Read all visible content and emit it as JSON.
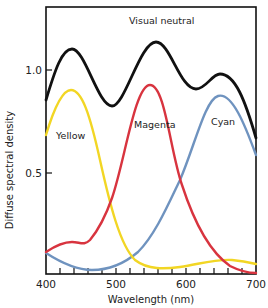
{
  "chart_data": {
    "type": "line",
    "title": "",
    "xlabel": "Wavelength (nm)",
    "ylabel": "Diffuse spectral density",
    "xlim": [
      400,
      700
    ],
    "ylim": [
      0,
      1.3
    ],
    "grid": false,
    "legend": "inline labels",
    "x_ticks": [
      400,
      500,
      600,
      700
    ],
    "x_tick_labels": [
      "400",
      "500",
      "600",
      "700"
    ],
    "x_minor_tick_step": 20,
    "y_ticks": [
      0.5,
      1.0
    ],
    "y_tick_labels": [
      "0.5",
      "1.0"
    ],
    "x": [
      400,
      420,
      440,
      460,
      480,
      500,
      520,
      540,
      560,
      580,
      600,
      620,
      640,
      660,
      680,
      700
    ],
    "series": [
      {
        "name": "Visual neutral",
        "color": "#111111",
        "values": [
          0.85,
          1.05,
          1.1,
          1.04,
          0.9,
          0.82,
          0.92,
          1.1,
          1.15,
          1.06,
          0.96,
          0.93,
          0.98,
          0.98,
          0.88,
          0.67
        ]
      },
      {
        "name": "Yellow",
        "color": "#f2d624",
        "values": [
          0.68,
          0.85,
          0.9,
          0.78,
          0.55,
          0.33,
          0.15,
          0.05,
          0.03,
          0.03,
          0.03,
          0.04,
          0.06,
          0.07,
          0.07,
          0.06
        ]
      },
      {
        "name": "Magenta",
        "color": "#d8343f",
        "values": [
          0.11,
          0.15,
          0.16,
          0.17,
          0.26,
          0.43,
          0.65,
          0.88,
          0.93,
          0.7,
          0.38,
          0.17,
          0.08,
          0.04,
          0.02,
          0.01
        ]
      },
      {
        "name": "Cyan",
        "color": "#6f93bf",
        "values": [
          0.11,
          0.07,
          0.04,
          0.03,
          0.04,
          0.06,
          0.11,
          0.22,
          0.38,
          0.55,
          0.72,
          0.85,
          0.9,
          0.86,
          0.74,
          0.6
        ]
      }
    ],
    "annotations": [
      {
        "text": "Visual neutral",
        "x": 540,
        "y": 1.23
      },
      {
        "text": "Yellow",
        "x": 412,
        "y": 0.67
      },
      {
        "text": "Magenta",
        "x": 520,
        "y": 0.73
      },
      {
        "text": "Cyan",
        "x": 630,
        "y": 0.76
      }
    ]
  },
  "labels": {
    "xlabel": "Wavelength (nm)",
    "ylabel": "Diffuse spectral density",
    "visual_neutral": "Visual neutral",
    "yellow": "Yellow",
    "magenta": "Magenta",
    "cyan": "Cyan",
    "x400": "400",
    "x500": "500",
    "x600": "600",
    "x700": "700",
    "y05": "0.5",
    "y10": "1.0"
  }
}
